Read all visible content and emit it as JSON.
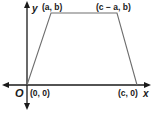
{
  "diagram": {
    "type": "coordinate-plane-trapezoid",
    "axes": {
      "x_label": "x",
      "y_label": "y",
      "origin_label": "O"
    },
    "vertices": [
      {
        "name": "origin",
        "label": "(0, 0)",
        "px": [
          27,
          85
        ]
      },
      {
        "name": "top-left",
        "label": "(a, b)",
        "px": [
          51,
          13
        ]
      },
      {
        "name": "top-right",
        "label": "(c − a, b)",
        "px": [
          117,
          13
        ]
      },
      {
        "name": "bottom-right",
        "label": "(c, 0)",
        "px": [
          137,
          85
        ]
      }
    ],
    "colors": {
      "axis": "#1a1a1a",
      "shape": "#6e6e6e",
      "text": "#1a1a1a"
    }
  }
}
